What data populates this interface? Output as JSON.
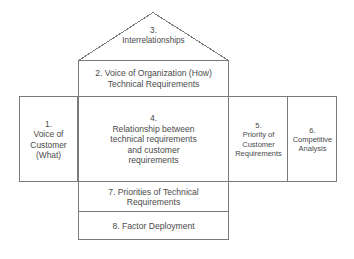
{
  "diagram": {
    "stroke_color": "#7a7a7a",
    "text_color": "#4a4a4a",
    "background_color": "#ffffff",
    "cells": [
      {
        "id": "3",
        "name": "interrelationships",
        "number": "3.",
        "lines": [
          "3.",
          "Interrelationships"
        ]
      },
      {
        "id": "2",
        "name": "voice-of-organization",
        "number": "2.",
        "lines": [
          "2. Voice of Organization (How)",
          "Technical Requirements"
        ]
      },
      {
        "id": "1",
        "name": "voice-of-customer",
        "number": "1.",
        "lines": [
          "1.",
          "Voice of",
          "Customer",
          "(What)"
        ]
      },
      {
        "id": "4",
        "name": "relationship-matrix",
        "number": "4.",
        "lines": [
          "4.",
          "Relationship between",
          "technical requirements",
          "and customer",
          "requirements"
        ]
      },
      {
        "id": "5",
        "name": "priority-of-customer-requirements",
        "number": "5.",
        "lines": [
          "5.",
          "Priority of",
          "Customer",
          "Requirements"
        ]
      },
      {
        "id": "6",
        "name": "competitive-analysis",
        "number": "6.",
        "lines": [
          "6.",
          "Competitive",
          "Analysis"
        ]
      },
      {
        "id": "7",
        "name": "priorities-of-technical-requirements",
        "number": "7.",
        "lines": [
          "7.  Priorities of Technical",
          "Requirements"
        ]
      },
      {
        "id": "8",
        "name": "factor-deployment",
        "number": "8.",
        "lines": [
          "8.  Factor Deployment"
        ]
      }
    ]
  }
}
